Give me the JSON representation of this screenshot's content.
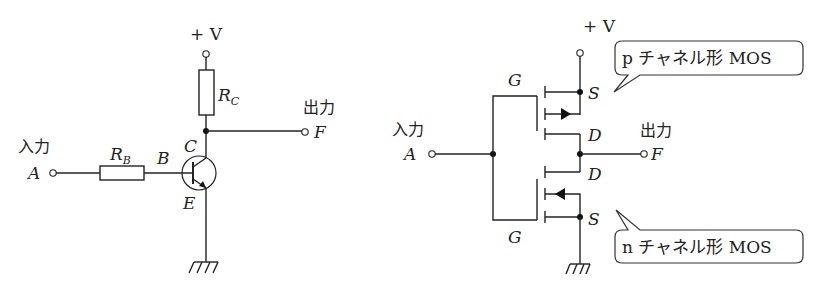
{
  "diagram": {
    "left_circuit": {
      "name": "BJT inverter",
      "supply_label": "+ V",
      "input_label": "入力",
      "input_terminal": "A",
      "output_label": "出力",
      "output_terminal": "F",
      "base_resistor": {
        "symbol": "R",
        "subscript": "B"
      },
      "collector_resistor": {
        "symbol": "R",
        "subscript": "C"
      },
      "pins": {
        "base": "B",
        "collector": "C",
        "emitter": "E"
      }
    },
    "right_circuit": {
      "name": "CMOS inverter",
      "supply_label": "+ V",
      "input_label": "入力",
      "input_terminal": "A",
      "output_label": "出力",
      "output_terminal": "F",
      "pmos": {
        "gate": "G",
        "source": "S",
        "drain": "D",
        "callout": "p チャネル形 MOS"
      },
      "nmos": {
        "gate": "G",
        "source": "S",
        "drain": "D",
        "callout": "n チャネル形 MOS"
      }
    }
  }
}
